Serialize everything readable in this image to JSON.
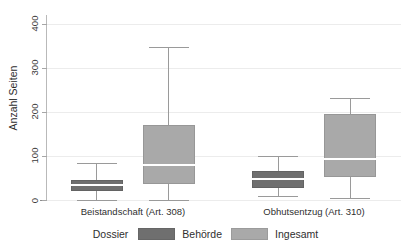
{
  "chart_data": {
    "type": "box",
    "title": "",
    "xlabel": "",
    "ylabel": "Anzahl Seiten",
    "ylim": [
      0,
      420
    ],
    "yticks": [
      0,
      100,
      200,
      300,
      400
    ],
    "ytick_labels": [
      "0",
      "100",
      "200",
      "300",
      "400"
    ],
    "grid": true,
    "legend_position": "bottom",
    "legend_title": "Dossier",
    "categories": [
      "Beistandschaft (Art. 308)",
      "Obhutsentzug (Art. 310)"
    ],
    "series": [
      {
        "name": "Behörde",
        "color": "#6f6f6f",
        "boxes": [
          {
            "category": "Beistandschaft (Art. 308)",
            "whisker_low": 0,
            "q1": 20,
            "median": 34,
            "q3": 45,
            "whisker_high": 85
          },
          {
            "category": "Obhutsentzug (Art. 310)",
            "whisker_low": 10,
            "q1": 27,
            "median": 47,
            "q3": 65,
            "whisker_high": 99
          }
        ]
      },
      {
        "name": "Ingesamt",
        "color": "#a9a9a9",
        "boxes": [
          {
            "category": "Beistandschaft (Art. 308)",
            "whisker_low": 0,
            "q1": 37,
            "median": 80,
            "q3": 170,
            "whisker_high": 348
          },
          {
            "category": "Obhutsentzug (Art. 310)",
            "whisker_low": 4,
            "q1": 53,
            "median": 93,
            "q3": 196,
            "whisker_high": 232
          }
        ]
      }
    ]
  },
  "axis": {
    "y_title": "Anzahl Seiten",
    "y_tick_0": "0",
    "y_tick_1": "100",
    "y_tick_2": "200",
    "y_tick_3": "300",
    "y_tick_4": "400",
    "x_cat_0": "Beistandschaft (Art. 308)",
    "x_cat_1": "Obhutsentzug (Art. 310)"
  },
  "legend": {
    "title": "Dossier",
    "item_0": "Behörde",
    "item_1": "Ingesamt"
  },
  "colors": {
    "behoerde": "#6f6f6f",
    "ingesamt": "#a9a9a9",
    "grid": "#ececec",
    "axis": "#8c8c8c",
    "text": "#2f2f2f"
  }
}
